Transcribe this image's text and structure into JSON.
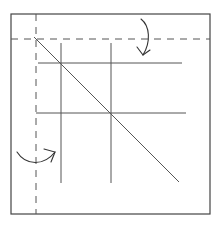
{
  "diagram": {
    "type": "origami-fold-diagram",
    "colors": {
      "background": "#ffffff",
      "line": "#555555",
      "frame": "#444444",
      "arrow": "#333333"
    },
    "elements": {
      "outer_square": {
        "x1": 11,
        "y1": 14,
        "x2": 210,
        "y2": 214
      },
      "fold_lines_dashed": [
        {
          "orientation": "horizontal",
          "y": 39,
          "x1": 11,
          "x2": 210
        },
        {
          "orientation": "vertical",
          "x": 36,
          "y1": 14,
          "y2": 214
        }
      ],
      "crease_lines": [
        {
          "orientation": "vertical",
          "x": 61,
          "y1": 43,
          "y2": 183
        },
        {
          "orientation": "vertical",
          "x": 111,
          "y1": 43,
          "y2": 183
        },
        {
          "orientation": "horizontal",
          "y": 63,
          "x1": 38,
          "x2": 182
        },
        {
          "orientation": "horizontal",
          "y": 113,
          "x1": 36,
          "x2": 186
        }
      ],
      "diagonal": {
        "x1": 34,
        "y1": 37,
        "x2": 179,
        "y2": 182
      },
      "arrows": [
        {
          "name": "fold-top-down-arrow",
          "direction": "down"
        },
        {
          "name": "fold-left-right-arrow",
          "direction": "right"
        }
      ]
    }
  }
}
